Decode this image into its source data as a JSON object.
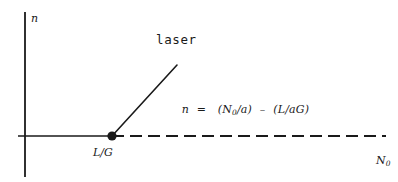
{
  "figure": {
    "kind": "laser-threshold-diagram",
    "background_color": "#ffffff",
    "stroke_color": "#1a1a1a",
    "axes": {
      "vertical_axis_label": "n",
      "horizontal_axis_label_prefix": "N",
      "horizontal_axis_label_subscript": "0"
    },
    "labels": {
      "laser_region": "laser",
      "threshold_point": "L/G"
    },
    "equation": {
      "lhs": "n",
      "equals": "=",
      "term_1_open": "(",
      "term_1_numerator": "N",
      "term_1_numerator_subscript": "0",
      "term_1_slash": "/",
      "term_1_denominator": "a",
      "term_1_close": ")",
      "operator": "–",
      "term_2_open": "(",
      "term_2_numerator": "L",
      "term_2_slash": "/",
      "term_2_denominator": "aG",
      "term_2_close": ")"
    },
    "geometry": {
      "vertical_axis_x": 25,
      "vertical_axis_top_y": 12,
      "vertical_axis_bottom_y": 177,
      "horizontal_axis_y": 136,
      "solid_segment_start_x": 18,
      "threshold_point_x": 112,
      "dashed_segment_end_x": 386,
      "dash_length": 12,
      "dash_gap": 6,
      "laser_line_top_x": 177,
      "laser_line_top_y": 65,
      "dot_radius": 4.5,
      "line_width": 1.6
    }
  }
}
